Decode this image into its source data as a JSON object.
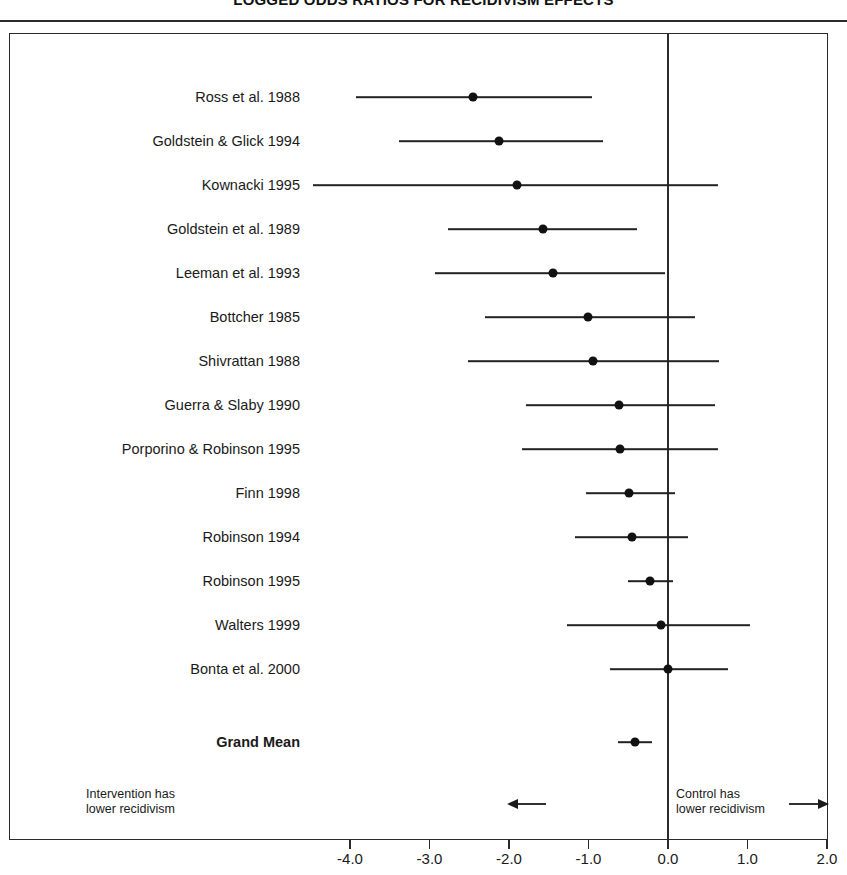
{
  "chart_data": {
    "type": "scatter",
    "subtype": "forest-plot",
    "title": "LOGGED ODDS RATIOS FOR RECIDIVISM EFFECTS",
    "xlabel": "",
    "ylabel": "",
    "xlim": [
      -4.6,
      2.3
    ],
    "grid": false,
    "legend": "none",
    "reference_line": 0.0,
    "xticks": [
      -4.0,
      -3.0,
      -2.0,
      -1.0,
      0.0,
      1.0,
      2.0
    ],
    "xtick_labels": [
      "-4.0",
      "-3.0",
      "-2.0",
      "-1.0",
      "0.0",
      "1.0",
      "2.0"
    ],
    "categories": [
      "Ross et al. 1988",
      "Goldstein & Glick 1994",
      "Kownacki 1995",
      "Goldstein et al. 1989",
      "Leeman et al. 1993",
      "Bottcher 1985",
      "Shivrattan 1988",
      "Guerra & Slaby 1990",
      "Porporino & Robinson 1995",
      "Finn 1998",
      "Robinson 1994",
      "Robinson 1995",
      "Walters 1999",
      "Bonta et al. 2000",
      "Grand Mean"
    ],
    "rows": [
      {
        "label": "Ross et al. 1988",
        "estimate": -2.45,
        "ci_low": -3.93,
        "ci_high": -0.95,
        "summary": false
      },
      {
        "label": "Goldstein & Glick 1994",
        "estimate": -2.12,
        "ci_low": -3.38,
        "ci_high": -0.82,
        "summary": false
      },
      {
        "label": "Kownacki 1995",
        "estimate": -1.9,
        "ci_low": -4.46,
        "ci_high": 0.63,
        "summary": false
      },
      {
        "label": "Goldstein et al. 1989",
        "estimate": -1.57,
        "ci_low": -2.77,
        "ci_high": -0.39,
        "summary": false
      },
      {
        "label": "Leeman et al. 1993",
        "estimate": -1.45,
        "ci_low": -2.93,
        "ci_high": -0.04,
        "summary": false
      },
      {
        "label": "Bottcher 1985",
        "estimate": -1.01,
        "ci_low": -2.3,
        "ci_high": 0.34,
        "summary": false
      },
      {
        "label": "Shivrattan 1988",
        "estimate": -0.94,
        "ci_low": -2.52,
        "ci_high": 0.64,
        "summary": false
      },
      {
        "label": "Guerra & Slaby 1990",
        "estimate": -0.62,
        "ci_low": -1.79,
        "ci_high": 0.59,
        "summary": false
      },
      {
        "label": "Porporino & Robinson 1995",
        "estimate": -0.6,
        "ci_low": -1.84,
        "ci_high": 0.63,
        "summary": false
      },
      {
        "label": "Finn 1998",
        "estimate": -0.49,
        "ci_low": -1.03,
        "ci_high": 0.09,
        "summary": false
      },
      {
        "label": "Robinson 1994",
        "estimate": -0.45,
        "ci_low": -1.17,
        "ci_high": 0.25,
        "summary": false
      },
      {
        "label": "Robinson 1995",
        "estimate": -0.23,
        "ci_low": -0.5,
        "ci_high": 0.06,
        "summary": false
      },
      {
        "label": "Walters 1999",
        "estimate": -0.09,
        "ci_low": -1.27,
        "ci_high": 1.03,
        "summary": false
      },
      {
        "label": "Bonta et al. 2000",
        "estimate": 0.0,
        "ci_low": -0.73,
        "ci_high": 0.75,
        "summary": false
      },
      {
        "label": "Grand Mean",
        "estimate": -0.41,
        "ci_low": -0.63,
        "ci_high": -0.2,
        "summary": true
      }
    ],
    "annotations": [
      {
        "id": "left",
        "line1": "Intervention has",
        "line2": "lower recidivism",
        "arrow": "left-arrow-icon"
      },
      {
        "id": "right",
        "line1": "Control has",
        "line2": "lower recidivism",
        "arrow": "right-arrow-icon"
      }
    ]
  },
  "colors": {
    "ink": "#1a1a1a",
    "line": "#2b2b2b",
    "marker": "#111111",
    "background": "#ffffff"
  }
}
